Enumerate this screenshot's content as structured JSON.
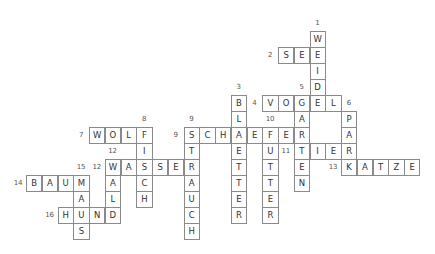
{
  "puzzle": {
    "type": "crossword",
    "language": "German",
    "words": [
      {
        "number": "1",
        "direction": "down",
        "answer": "WEIDE",
        "col": 18,
        "row": 0
      },
      {
        "number": "2",
        "direction": "across",
        "answer": "SEE",
        "col": 16,
        "row": 1
      },
      {
        "number": "3",
        "direction": "down",
        "answer": "BLAETTER",
        "col": 13,
        "row": 4
      },
      {
        "number": "4",
        "direction": "across",
        "answer": "VOGEL",
        "col": 15,
        "row": 4
      },
      {
        "number": "5",
        "direction": "down",
        "answer": "GARTEN",
        "col": 17,
        "row": 4
      },
      {
        "number": "6",
        "direction": "down",
        "answer": "PARK",
        "col": 20,
        "row": 5
      },
      {
        "number": "7",
        "direction": "across",
        "answer": "WOLF",
        "col": 4,
        "row": 6
      },
      {
        "number": "8",
        "direction": "down",
        "answer": "FISCH",
        "col": 7,
        "row": 6
      },
      {
        "number": "9",
        "direction": "across",
        "answer": "SCHAEFER",
        "col": 10,
        "row": 6
      },
      {
        "number": "9",
        "direction": "down",
        "answer": "STRAUCH",
        "col": 10,
        "row": 6
      },
      {
        "number": "10",
        "direction": "down",
        "answer": "FUTTER",
        "col": 15,
        "row": 6
      },
      {
        "number": "11",
        "direction": "across",
        "answer": "TIER",
        "col": 17,
        "row": 7
      },
      {
        "number": "12",
        "direction": "across",
        "answer": "WASSER",
        "col": 5,
        "row": 8
      },
      {
        "number": "12",
        "direction": "down",
        "answer": "WALD",
        "col": 5,
        "row": 8
      },
      {
        "number": "13",
        "direction": "across",
        "answer": "KATZE",
        "col": 20,
        "row": 8
      },
      {
        "number": "14",
        "direction": "across",
        "answer": "BAUM",
        "col": 0,
        "row": 9
      },
      {
        "number": "15",
        "direction": "down",
        "answer": "MAUS",
        "col": 3,
        "row": 9
      },
      {
        "number": "16",
        "direction": "across",
        "answer": "HUND",
        "col": 2,
        "row": 11
      }
    ]
  }
}
